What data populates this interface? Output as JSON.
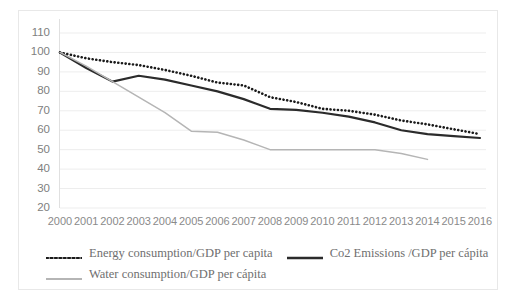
{
  "chart_data": {
    "type": "line",
    "title": "",
    "xlabel": "",
    "ylabel": "",
    "x": [
      2000,
      2001,
      2002,
      2003,
      2004,
      2005,
      2006,
      2007,
      2008,
      2009,
      2010,
      2011,
      2012,
      2013,
      2014,
      2015,
      2016
    ],
    "categories": [
      "2000",
      "2001",
      "2002",
      "2003",
      "2004",
      "2005",
      "2006",
      "2007",
      "2008",
      "2009",
      "2010",
      "2011",
      "2012",
      "2013",
      "2014",
      "2015",
      "2016"
    ],
    "ylim": [
      20,
      110
    ],
    "yticks": [
      20,
      30,
      40,
      50,
      60,
      70,
      80,
      90,
      100,
      110
    ],
    "ytick_labels": [
      "20",
      "30",
      "40",
      "50",
      "60",
      "70",
      "80",
      "90",
      "100",
      "110"
    ],
    "grid": "horizontal",
    "legend_position": "bottom",
    "series": [
      {
        "name": "Energy consumption/GDP per capita",
        "style": "dotted",
        "color": "#1a1a1a",
        "values": [
          100,
          97,
          95,
          93.5,
          91,
          88,
          84.5,
          83,
          77,
          74.5,
          71,
          70,
          68,
          65,
          63,
          60.5,
          58
        ]
      },
      {
        "name": "Co2 Emissions /GDP per cápita",
        "style": "solid",
        "color": "#2b2b2b",
        "values": [
          100,
          92,
          85,
          88,
          86,
          83,
          80,
          76,
          71,
          70.5,
          69,
          67,
          64,
          60,
          58,
          57,
          56
        ]
      },
      {
        "name": "Water consumption/GDP per cápita",
        "style": "solid",
        "color": "#b5b5b5",
        "values": [
          100,
          93,
          85,
          77,
          69,
          59.5,
          59,
          55,
          50,
          50,
          50,
          50,
          50,
          48,
          45,
          null,
          null
        ]
      }
    ]
  },
  "legend": {
    "items": [
      {
        "label": "Energy consumption/GDP per capita",
        "marker": "dotted-line-swatch",
        "color": "#1a1a1a"
      },
      {
        "label": "Co2 Emissions /GDP per cápita",
        "marker": "solid-line-swatch",
        "color": "#2b2b2b"
      },
      {
        "label": "Water consumption/GDP per cápita",
        "marker": "solid-line-swatch",
        "color": "#b5b5b5"
      }
    ]
  },
  "axes": {
    "gridline_color": "#ededed",
    "tick_label_color": "#808080"
  }
}
